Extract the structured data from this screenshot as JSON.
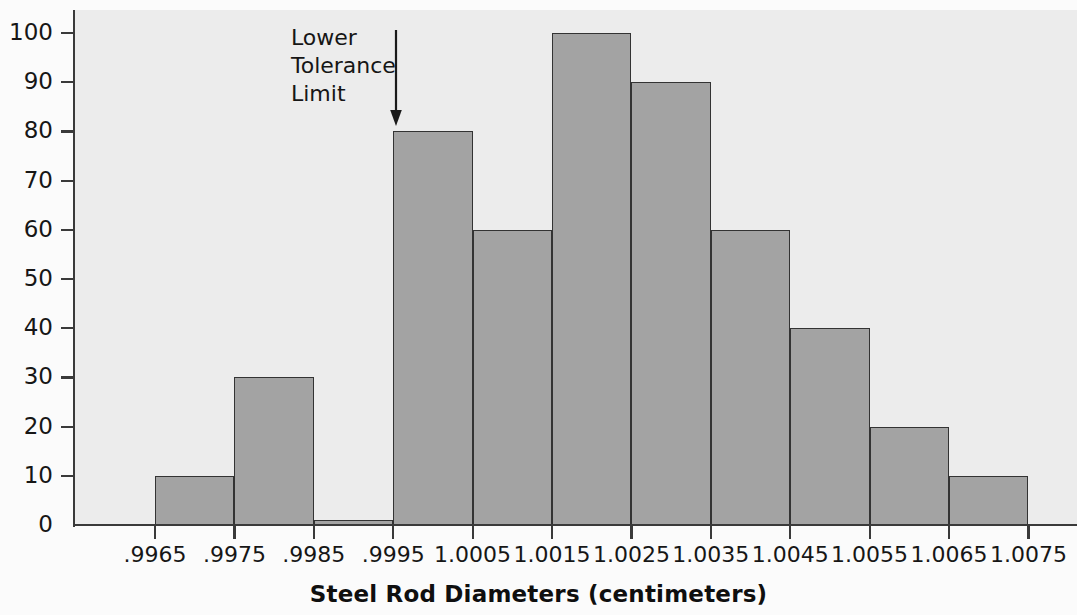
{
  "chart_data": {
    "type": "bar",
    "title": "",
    "xlabel": "Steel Rod Diameters (centimeters)",
    "ylabel": "",
    "xlim": [
      0.9965,
      1.0075
    ],
    "ylim": [
      0,
      105
    ],
    "grid": false,
    "legend": "none",
    "bin_width": 0.001,
    "bin_edges": [
      ".9965",
      ".9975",
      ".9985",
      ".9995",
      "1.0005",
      "1.0015",
      "1.0025",
      "1.0035",
      "1.0045",
      "1.0055",
      "1.0065",
      "1.0075"
    ],
    "categories": [
      ".9965-.9975",
      ".9975-.9985",
      ".9985-.9995",
      ".9995-1.0005",
      "1.0005-1.0015",
      "1.0015-1.0025",
      "1.0025-1.0035",
      "1.0035-1.0045",
      "1.0045-1.0055",
      "1.0055-1.0065",
      "1.0065-1.0075"
    ],
    "values": [
      10,
      30,
      1,
      80,
      60,
      100,
      90,
      60,
      40,
      20,
      10
    ],
    "x_tick_labels": [
      ".9965",
      ".9975",
      ".9985",
      ".9995",
      "1.0005",
      "1.0015",
      "1.0025",
      "1.0035",
      "1.0045",
      "1.0055",
      "1.0065",
      "1.0075"
    ],
    "y_tick_labels": [
      "0",
      "10",
      "20",
      "30",
      "40",
      "50",
      "60",
      "70",
      "80",
      "90",
      "100"
    ],
    "y_tick_values": [
      0,
      10,
      20,
      30,
      40,
      50,
      60,
      70,
      80,
      90,
      100
    ],
    "annotations": [
      {
        "text": "Lower\nTolerance\nLimit",
        "at_x": ".9995",
        "arrow": "down-arrow"
      }
    ],
    "colors": {
      "bar_fill": "#a3a3a3",
      "bar_edge": "#333333",
      "plot_background": "#ececec",
      "figure_background": "#fbfbfb",
      "axis": "#3a3a3a",
      "text": "#161616"
    }
  }
}
